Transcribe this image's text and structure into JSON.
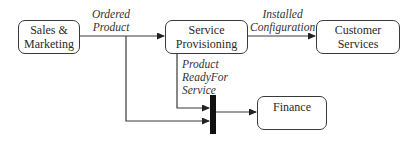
{
  "diagram": {
    "type": "process-flow",
    "nodes": [
      {
        "id": "sales",
        "lines": [
          "Sales &",
          "Marketing"
        ]
      },
      {
        "id": "provisioning",
        "lines": [
          "Service",
          "Provisioning"
        ]
      },
      {
        "id": "customer",
        "lines": [
          "Customer",
          "Services"
        ]
      },
      {
        "id": "finance",
        "lines": [
          "Finance"
        ]
      }
    ],
    "edges": [
      {
        "from": "sales",
        "to": "provisioning",
        "label_lines": [
          "Ordered",
          "Product"
        ]
      },
      {
        "from": "provisioning",
        "to": "customer",
        "label_lines": [
          "Installed",
          "Configuration"
        ]
      },
      {
        "from": "provisioning",
        "to": "join-bar",
        "label_lines": [
          "Product",
          "ReadyFor",
          "Service"
        ]
      },
      {
        "from": "sales",
        "to": "join-bar",
        "label_lines": []
      },
      {
        "from": "join-bar",
        "to": "finance",
        "label_lines": []
      }
    ],
    "colors": {
      "stroke": "#3a3a3a",
      "bar": "#111111",
      "background": "#ffffff"
    }
  }
}
